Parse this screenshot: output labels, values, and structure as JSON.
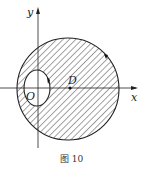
{
  "figure": {
    "caption": "图 10",
    "labels": {
      "x_axis": "x",
      "y_axis": "y",
      "origin": "O",
      "center": "D"
    },
    "colors": {
      "stroke": "#222222",
      "hatch": "#333333",
      "background": "#ffffff"
    },
    "shapes": {
      "big_circle": {
        "cx": 68,
        "cy": 89,
        "r": 51
      },
      "small_circle": {
        "cx": 37,
        "cy": 88,
        "rx": 13,
        "ry": 18
      },
      "center_point": {
        "cx": 70,
        "cy": 88
      }
    }
  }
}
